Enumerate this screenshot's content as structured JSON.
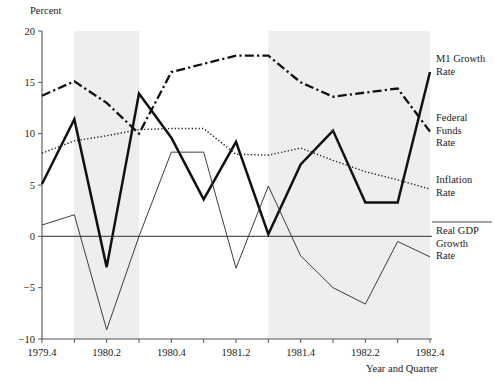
{
  "chart_data": {
    "type": "line",
    "title": "",
    "ylabel": "Percent",
    "xlabel": "Year and Quarter",
    "ylim": [
      -10,
      20
    ],
    "yticks": [
      -10,
      -5,
      0,
      5,
      10,
      15,
      20
    ],
    "ytick_labels": [
      "−10",
      "−5",
      "0",
      "5",
      "10",
      "15",
      "20"
    ],
    "grid": false,
    "legend_position": "right-inline",
    "x": [
      "1979.4",
      "1980.1",
      "1980.2",
      "1980.3",
      "1980.4",
      "1981.1",
      "1981.2",
      "1981.3",
      "1981.4",
      "1982.1",
      "1982.2",
      "1982.3",
      "1982.4"
    ],
    "xtick_labels": [
      "1979.4",
      "",
      "1980.2",
      "",
      "1980.4",
      "",
      "1981.2",
      "",
      "1981.4",
      "",
      "1982.2",
      "",
      "1982.4"
    ],
    "shaded_regions": [
      {
        "name": "recession-1980",
        "x_start": "1980.1",
        "x_end": "1980.3",
        "color": "#eeeeee"
      },
      {
        "name": "recession-1981-82",
        "x_start": "1981.3",
        "x_end": "1982.4",
        "color": "#eeeeee"
      }
    ],
    "series": [
      {
        "name": "M1 Growth Rate",
        "style": "dash-dot",
        "color": "#111111",
        "values": [
          13.7,
          15.1,
          13.0,
          10.0,
          16.0,
          16.8,
          17.6,
          17.6,
          15.0,
          13.6,
          14.0,
          14.4,
          10.2
        ]
      },
      {
        "name": "Federal Funds Rate",
        "style": "solid-thick",
        "color": "#111111",
        "values": [
          5.1,
          11.4,
          -3.0,
          13.9,
          9.6,
          3.6,
          9.2,
          0.2,
          7.0,
          10.3,
          3.3,
          3.3,
          16.0
        ]
      },
      {
        "name": "Inflation Rate",
        "style": "dotted",
        "color": "#222222",
        "values": [
          8.1,
          9.3,
          9.8,
          10.4,
          10.5,
          10.5,
          8.0,
          7.9,
          8.6,
          7.4,
          6.3,
          5.5,
          4.6
        ]
      },
      {
        "name": "Real GDP Growth Rate",
        "style": "solid-thin",
        "color": "#333333",
        "values": [
          1.1,
          2.1,
          -9.1,
          0.0,
          8.2,
          8.2,
          -3.1,
          4.9,
          -1.9,
          -5.0,
          -6.6,
          -0.5,
          -2.0
        ]
      }
    ]
  },
  "labels": {
    "y_axis_title": "Percent",
    "x_axis_title": "Year and Quarter",
    "legend": {
      "m1": [
        "M1 Growth",
        "Rate"
      ],
      "ffr": [
        "Federal",
        "Funds",
        "Rate"
      ],
      "inflation": [
        "Inflation",
        "Rate"
      ],
      "gdp": [
        "Real GDP",
        "Growth",
        "Rate"
      ]
    }
  }
}
